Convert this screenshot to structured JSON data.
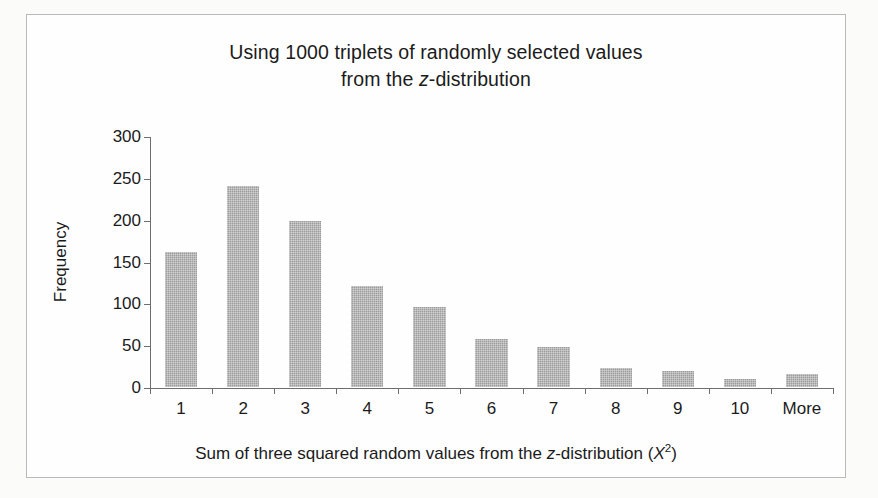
{
  "figure": {
    "title_line1": "Using 1000 triplets of randomly selected values",
    "title_line2_prefix": "from the ",
    "title_line2_italic": "z",
    "title_line2_suffix": "-distribution",
    "axis_title_y": "Frequency",
    "axis_title_x_part1": "Sum of three squared random values from the ",
    "axis_title_x_italic1": "z",
    "axis_title_x_part2": "-distribution (",
    "axis_title_x_italic2": "X",
    "axis_title_x_sup": "2",
    "axis_title_x_part3": ")",
    "bar_color": "#9c9c9c",
    "axis_color": "#6e6e6e",
    "frame_color": "#b9b9b9",
    "background": "#fefefe"
  },
  "chart_data": {
    "type": "bar",
    "title": "Using 1000 triplets of randomly selected values from the z-distribution",
    "xlabel": "Sum of three squared random values from the z-distribution (X^2)",
    "ylabel": "Frequency",
    "categories": [
      "1",
      "2",
      "3",
      "4",
      "5",
      "6",
      "7",
      "8",
      "9",
      "10",
      "More"
    ],
    "values": [
      161,
      240,
      199,
      121,
      96,
      57,
      48,
      23,
      19,
      10,
      15
    ],
    "ylim": [
      0,
      300
    ],
    "yticks": [
      0,
      50,
      100,
      150,
      200,
      250,
      300
    ],
    "ytick_labels": [
      "0",
      "50",
      "100",
      "150",
      "200",
      "250",
      "300"
    ],
    "grid": false,
    "legend": false,
    "legend_position": "none",
    "n_total": 1000,
    "series": [
      {
        "name": "Frequency",
        "values": [
          161,
          240,
          199,
          121,
          96,
          57,
          48,
          23,
          19,
          10,
          15
        ]
      }
    ]
  }
}
